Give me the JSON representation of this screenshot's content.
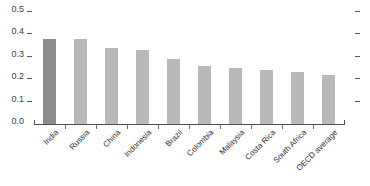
{
  "chart_data": {
    "type": "bar",
    "title": "",
    "subtitle": "",
    "xlabel": "",
    "ylabel": "",
    "categories": [
      "India",
      "Russia",
      "China",
      "Indonesia",
      "Brazil",
      "Colombia",
      "Malaysia",
      "Costa Rica",
      "South Africa",
      "OECD average"
    ],
    "values": [
      0.38,
      0.38,
      0.34,
      0.33,
      0.29,
      0.26,
      0.25,
      0.24,
      0.23,
      0.22
    ],
    "ylim": [
      0.0,
      0.5
    ],
    "ytick_labels": [
      "0.5",
      "0.4",
      "0.3",
      "0.2",
      "0.1",
      "0.0"
    ],
    "ytick_values": [
      0.5,
      0.4,
      0.3,
      0.2,
      0.1,
      0.0
    ],
    "grid": false,
    "legend": "none",
    "highlight_index": 0,
    "colors": {
      "bar_default": "#b9b9b9",
      "bar_highlight": "#8c8c8c",
      "axis": "#4d4d4d",
      "tick_text": "#3d3d3d",
      "label_text": "#2e2e2e",
      "background": "#ffffff"
    }
  }
}
